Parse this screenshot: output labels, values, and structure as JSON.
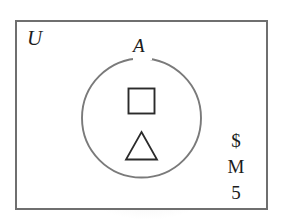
{
  "diagram": {
    "type": "venn-diagram",
    "universe": {
      "label": "U",
      "shape": "rectangle",
      "border_color": "#6f6f6f"
    },
    "sets": [
      {
        "label": "A",
        "shape": "circle",
        "border_color": "#7a7a7a"
      }
    ],
    "members_inside_set_a": [
      {
        "name": "square",
        "glyph": "□"
      },
      {
        "name": "triangle",
        "glyph": "△"
      }
    ],
    "members_outside_set_a": [
      {
        "name": "dollar-sign",
        "glyph": "$"
      },
      {
        "name": "letter-m",
        "glyph": "M"
      },
      {
        "name": "digit-five",
        "glyph": "5"
      }
    ],
    "colors": {
      "background": "#ffffff",
      "ink": "#1c1c1c",
      "rect_stroke": "#6f6f6f",
      "circle_stroke": "#7a7a7a",
      "shape_stroke": "#2b2b2b"
    }
  }
}
